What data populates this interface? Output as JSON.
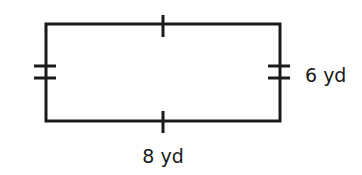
{
  "figure": {
    "shape": "rectangle",
    "stroke_color": "#1a1a1a",
    "background": "#ffffff",
    "labels": {
      "right_side": "6 yd",
      "bottom_side": "8 yd"
    },
    "tick_marks": {
      "top": 1,
      "bottom": 1,
      "left": 2,
      "right": 2
    },
    "dimensions": {
      "length": 8,
      "width": 6,
      "unit": "yd"
    }
  }
}
